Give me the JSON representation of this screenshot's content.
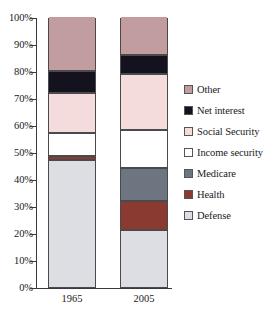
{
  "chart_data": {
    "type": "bar",
    "subtype": "stacked-percent",
    "title": "",
    "xlabel": "",
    "ylabel": "",
    "categories": [
      "1965",
      "2005"
    ],
    "ylim": [
      0,
      100
    ],
    "ytick_labels": [
      "0%",
      "10%",
      "20%",
      "30%",
      "40%",
      "50%",
      "60%",
      "70%",
      "80%",
      "90%",
      "100%"
    ],
    "ytick_values": [
      0,
      10,
      20,
      30,
      40,
      50,
      60,
      70,
      80,
      90,
      100
    ],
    "grid": false,
    "legend_position": "right",
    "series": [
      {
        "name": "Other",
        "color": "#c29da0",
        "values": [
          20.0,
          14.0
        ]
      },
      {
        "name": "Net interest",
        "color": "#14121f",
        "values": [
          8.0,
          7.0
        ]
      },
      {
        "name": "Social Security",
        "color": "#f5dcdc",
        "values": [
          15.0,
          21.0
        ]
      },
      {
        "name": "Income security",
        "color": "#ffffff",
        "values": [
          8.5,
          14.0
        ]
      },
      {
        "name": "Medicare",
        "color": "#6e7480",
        "values": [
          0.0,
          12.0
        ]
      },
      {
        "name": "Health",
        "color": "#8a3a30",
        "values": [
          1.5,
          11.0
        ]
      },
      {
        "name": "Defense",
        "color": "#dcdee3",
        "values": [
          47.0,
          21.0
        ]
      }
    ]
  },
  "legend": {
    "items": [
      {
        "label": "Other"
      },
      {
        "label": "Net interest"
      },
      {
        "label": "Social Security"
      },
      {
        "label": "Income security"
      },
      {
        "label": "Medicare"
      },
      {
        "label": "Health"
      },
      {
        "label": "Defense"
      }
    ]
  }
}
